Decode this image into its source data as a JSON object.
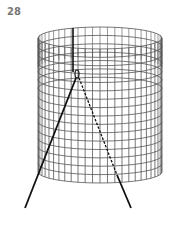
{
  "figure": {
    "number_label": "28",
    "colors": {
      "mesh": "#444444",
      "lines": "#222222",
      "label": "#777777"
    }
  }
}
